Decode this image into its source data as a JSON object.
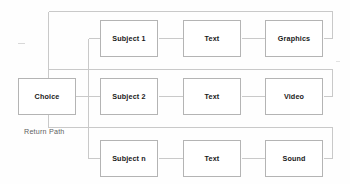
{
  "diagram": {
    "entry": {
      "label": "Choice"
    },
    "return_path_label": "Return Path",
    "colors": {
      "box_border": "#b4b4b4",
      "wire": "#c8c8c8",
      "text": "#191919",
      "label_text": "#5e5e5e",
      "background": "#fefefe"
    },
    "rows": [
      {
        "subject": "Subject 1",
        "media_kind": "Text",
        "terminal": "Graphics"
      },
      {
        "subject": "Subject 2",
        "media_kind": "Text",
        "terminal": "Video"
      },
      {
        "subject": "Subject n",
        "media_kind": "Text",
        "terminal": "Sound"
      }
    ]
  }
}
